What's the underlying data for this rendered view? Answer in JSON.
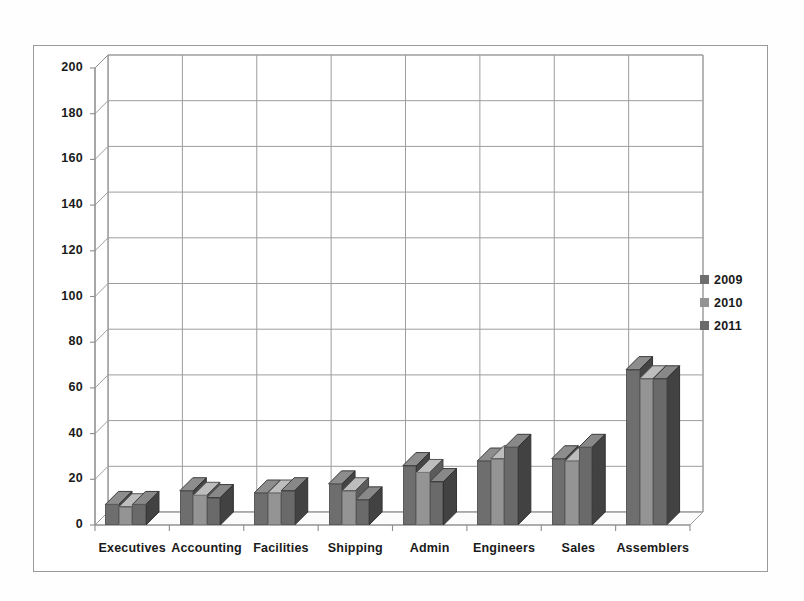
{
  "chart_data": {
    "type": "bar",
    "title": "",
    "subtitle": "",
    "xlabel": "",
    "ylabel": "",
    "ylim": [
      0,
      200
    ],
    "ytick_step": 20,
    "yticks": [
      200,
      180,
      160,
      140,
      120,
      100,
      80,
      60,
      40,
      20,
      0
    ],
    "grid": true,
    "grid_axis": "y",
    "style": "3d-clustered-column",
    "legend_position": "right",
    "categories": [
      "Executives",
      "Accounting",
      "Facilities",
      "Shipping",
      "Admin",
      "Engineers",
      "Sales",
      "Assemblers"
    ],
    "series": [
      {
        "name": "2009",
        "color": "#6e6e6e",
        "values": [
          9,
          15,
          14,
          18,
          26,
          28,
          29,
          68
        ]
      },
      {
        "name": "2010",
        "color": "#949494",
        "values": [
          8,
          13,
          14,
          15,
          23,
          29,
          28,
          64
        ]
      },
      {
        "name": "2011",
        "color": "#6a6a6a",
        "values": [
          9,
          12,
          15,
          11,
          19,
          34,
          34,
          64
        ]
      }
    ]
  },
  "axis": {
    "y_labels": [
      "200",
      "180",
      "160",
      "140",
      "120",
      "100",
      "80",
      "60",
      "40",
      "20",
      "0"
    ],
    "x_labels": [
      "Executives",
      "Accounting",
      "Facilities",
      "Shipping",
      "Admin",
      "Engineers",
      "Sales",
      "Assemblers"
    ]
  },
  "legend": {
    "items": [
      {
        "label": "2009",
        "color": "#6e6e6e"
      },
      {
        "label": "2010",
        "color": "#949494"
      },
      {
        "label": "2011",
        "color": "#6a6a6a"
      }
    ]
  },
  "colors": {
    "axis_line": "#8d8d8d",
    "grid_line": "#9d9d9d",
    "frame": "#9a9a9a",
    "floor": "#fbfbfb",
    "text": "#1a1a1a"
  }
}
